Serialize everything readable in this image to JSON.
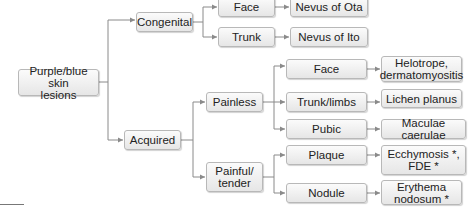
{
  "diagram": {
    "type": "tree",
    "root": {
      "id": "root",
      "label": "Purple/blue skin\nlesions"
    },
    "nodes": [
      {
        "id": "congenital",
        "label": "Congenital"
      },
      {
        "id": "acquired",
        "label": "Acquired"
      },
      {
        "id": "cong_face",
        "label": "Face"
      },
      {
        "id": "cong_trunk",
        "label": "Trunk"
      },
      {
        "id": "nevus_ota",
        "label": "Nevus of Ota"
      },
      {
        "id": "nevus_ito",
        "label": "Nevus of Ito"
      },
      {
        "id": "painless",
        "label": "Painless"
      },
      {
        "id": "painful",
        "label": "Painful/\ntender"
      },
      {
        "id": "acq_face",
        "label": "Face"
      },
      {
        "id": "trunk_limbs",
        "label": "Trunk/limbs"
      },
      {
        "id": "pubic",
        "label": "Pubic"
      },
      {
        "id": "plaque",
        "label": "Plaque"
      },
      {
        "id": "nodule",
        "label": "Nodule"
      },
      {
        "id": "helotrope",
        "label": "Helotrope,\ndermatomyositis"
      },
      {
        "id": "lichen",
        "label": "Lichen planus"
      },
      {
        "id": "maculae",
        "label": "Maculae caerulae"
      },
      {
        "id": "ecchymosis",
        "label": "Ecchymosis *,\nFDE *"
      },
      {
        "id": "erythema",
        "label": "Erythema\nnodosum *"
      }
    ],
    "edges": [
      [
        "root",
        "congenital"
      ],
      [
        "root",
        "acquired"
      ],
      [
        "congenital",
        "cong_face"
      ],
      [
        "congenital",
        "cong_trunk"
      ],
      [
        "cong_face",
        "nevus_ota"
      ],
      [
        "cong_trunk",
        "nevus_ito"
      ],
      [
        "acquired",
        "painless"
      ],
      [
        "acquired",
        "painful"
      ],
      [
        "painless",
        "acq_face"
      ],
      [
        "painless",
        "trunk_limbs"
      ],
      [
        "painless",
        "pubic"
      ],
      [
        "painful",
        "plaque"
      ],
      [
        "painful",
        "nodule"
      ],
      [
        "acq_face",
        "helotrope"
      ],
      [
        "trunk_limbs",
        "lichen"
      ],
      [
        "pubic",
        "maculae"
      ],
      [
        "plaque",
        "ecchymosis"
      ],
      [
        "nodule",
        "erythema"
      ]
    ],
    "colors": {
      "edge": "#8a8a8a",
      "node_border": "#b8b8b8",
      "node_fill_top": "#fbfbfb",
      "node_fill_bottom": "#e6e6e6",
      "text": "#222222"
    }
  }
}
